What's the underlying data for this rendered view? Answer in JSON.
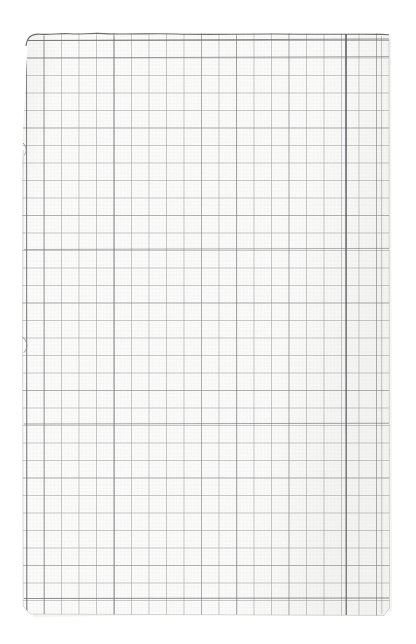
{
  "image": {
    "subject": "scanned-grid-paper-sheet",
    "description": "A scanned sheet of squared / graph paper photographed on a white background. The sheet is blank apart from its printed grid. The top edge is slightly wavy and torn, the left edge shows two small tear notches, and one vertical grid line near the right side is printed noticeably darker than the rest.",
    "orientation": "portrait",
    "width_px": 416,
    "height_px": 644,
    "background_color": "#ffffff"
  },
  "paper": {
    "label": "grid paper sheet",
    "left_px": 22,
    "top_px": 33,
    "right_px": 390,
    "bottom_px": 616,
    "fill_color": "#fdfdfc",
    "shadow_color": "#ececea",
    "edge_color": "#8d8d8a",
    "texture_tint": "#f7f7f5"
  },
  "grid": {
    "label": "printed square grid",
    "cell_size_px": 17.5,
    "columns": 21,
    "rows": 33,
    "origin_x_px": 26,
    "origin_y_px": 40,
    "line_color": "#6d6d70",
    "line_color_faint": "#b9b9bc",
    "line_width_px": 1,
    "minor_dot_color": "#cfcfd2",
    "subdivisions_per_cell": 5
  },
  "features": {
    "dark_vertical_line": {
      "label": "over-inked vertical rule",
      "x_px": 346,
      "color": "#43434a",
      "width_px": 2
    },
    "top_edge": {
      "label": "wavy torn top edge",
      "color": "#5a5a58"
    },
    "tear_notches": [
      {
        "label": "left edge tear notch upper",
        "x_px": 22,
        "y_px": 150
      },
      {
        "label": "left edge tear notch lower",
        "x_px": 22,
        "y_px": 345
      }
    ],
    "corner_radius_px": 6
  },
  "accessibility": {
    "alt_text": "Scan of a blank sheet of square grid paper with a torn top edge and one darker vertical printed line toward the right side."
  }
}
